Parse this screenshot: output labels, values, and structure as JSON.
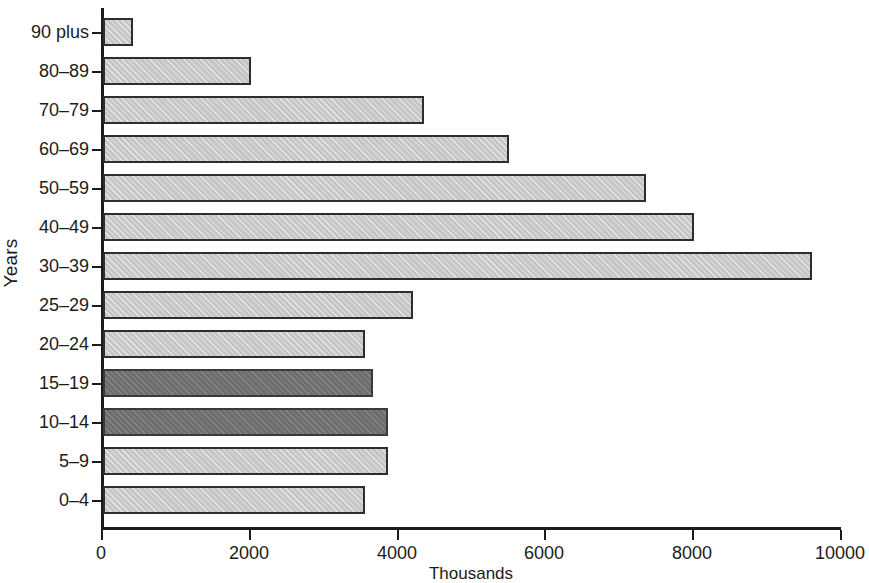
{
  "chart_data": {
    "type": "bar",
    "orientation": "horizontal",
    "title": "",
    "xlabel": "Thousands",
    "ylabel": "Years",
    "xlim": [
      0,
      10000
    ],
    "xticks": [
      0,
      2000,
      4000,
      6000,
      8000,
      10000
    ],
    "xtick_labels": [
      "0",
      "2000",
      "4000",
      "6000",
      "8000",
      "10000"
    ],
    "grid": false,
    "legend": null,
    "categories": [
      "90 plus",
      "80–89",
      "70–79",
      "60–69",
      "50–59",
      "40–49",
      "30–39",
      "25–29",
      "20–24",
      "15–19",
      "10–14",
      "5–9",
      "0–4"
    ],
    "values": [
      400,
      2000,
      4350,
      5500,
      7350,
      8000,
      9600,
      4200,
      3550,
      3650,
      3850,
      3850,
      3550
    ],
    "bar_colors": [
      "light",
      "light",
      "light",
      "light",
      "light",
      "light",
      "light",
      "light",
      "light",
      "dark",
      "dark",
      "light",
      "light"
    ],
    "colors": {
      "light_fill": "#c6c6c6",
      "dark_fill": "#6e6e6e",
      "outline": "#2e2e2e",
      "axis": "#1b1b1b",
      "background": "#ffffff"
    }
  }
}
